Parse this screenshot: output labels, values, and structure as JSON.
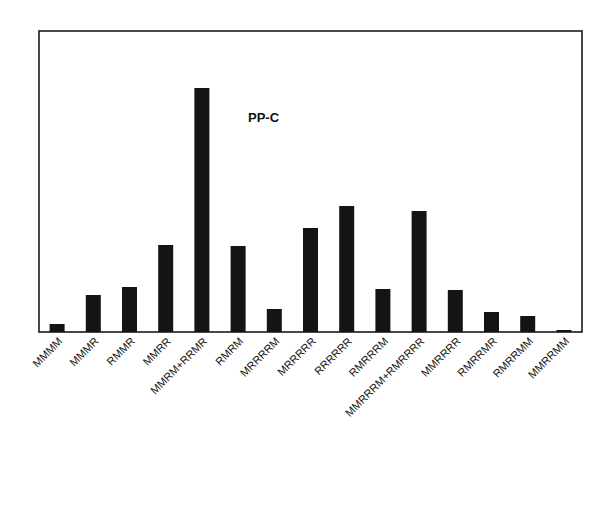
{
  "chart_data": {
    "type": "bar",
    "title": "PP-C",
    "xlabel": "",
    "ylabel": "",
    "categories": [
      "MMMM",
      "MMMR",
      "RMMR",
      "MMRR",
      "MMRM+RRMR",
      "RMRM",
      "MRRRRM",
      "MRRRRR",
      "RRRRRR",
      "RMRRRM",
      "MMRRRM+RMRRRR",
      "MMRRRR",
      "RMRRMR",
      "RMRRMM",
      "MMRRMM"
    ],
    "values": [
      8,
      37,
      45,
      87,
      244,
      86,
      23,
      104,
      126,
      43,
      121,
      42,
      20,
      16,
      2
    ],
    "value_units": "relative bar height (no y-axis shown)",
    "ylim": [
      0,
      300
    ],
    "grid": false,
    "legend": null,
    "tick_label_rotation": -45,
    "bar_color": "#141414"
  }
}
